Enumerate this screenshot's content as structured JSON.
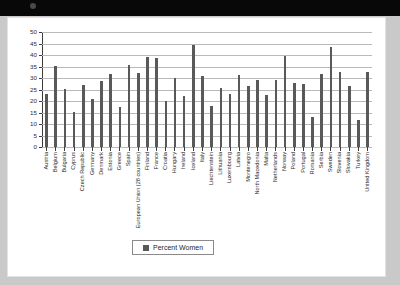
{
  "window": {
    "titlebar_color": "#080808"
  },
  "chart_data": {
    "type": "bar",
    "title": "",
    "xlabel": "",
    "ylabel": "",
    "ylim": [
      0,
      50
    ],
    "ytick_step": 5,
    "yticks": [
      "50",
      "45",
      "40",
      "35",
      "30",
      "25",
      "20",
      "15",
      "10",
      "5",
      "0"
    ],
    "grid": true,
    "legend_position": "bottom",
    "legend": [
      "Percent Women"
    ],
    "series_color": "#595959",
    "categories": [
      "Austria",
      "Belgium",
      "Bulgaria",
      "Cyprus",
      "Czech Republic",
      "Germany",
      "Denmark",
      "Estonia",
      "Greece",
      "Spain",
      "European Union (28 countries)",
      "Finland",
      "France",
      "Croatia",
      "Hungary",
      "Ireland",
      "Iceland",
      "Italy",
      "Liechtenstein",
      "Lithuania",
      "Luxembourg",
      "Latvia",
      "Montenegro",
      "North Macedonia",
      "Malta",
      "Netherlands",
      "Norway",
      "Poland",
      "Portugal",
      "Romania",
      "Serbia",
      "Sweden",
      "Slovenia",
      "Slovakia",
      "Turkey",
      "United Kingdom"
    ],
    "series": [
      {
        "name": "Percent Women",
        "values": [
          22.9,
          35.2,
          25.3,
          15.2,
          27.1,
          20.9,
          28.6,
          31.9,
          17.3,
          35.7,
          32.3,
          39.2,
          38.9,
          20.0,
          30.2,
          22.0,
          44.2,
          30.7,
          17.7,
          25.5,
          23.0,
          31.5,
          26.7,
          29.2,
          22.4,
          29.1,
          39.4,
          28.0,
          27.4,
          13.0,
          31.8,
          43.6,
          32.4,
          26.4,
          11.6,
          32.5
        ]
      }
    ]
  }
}
